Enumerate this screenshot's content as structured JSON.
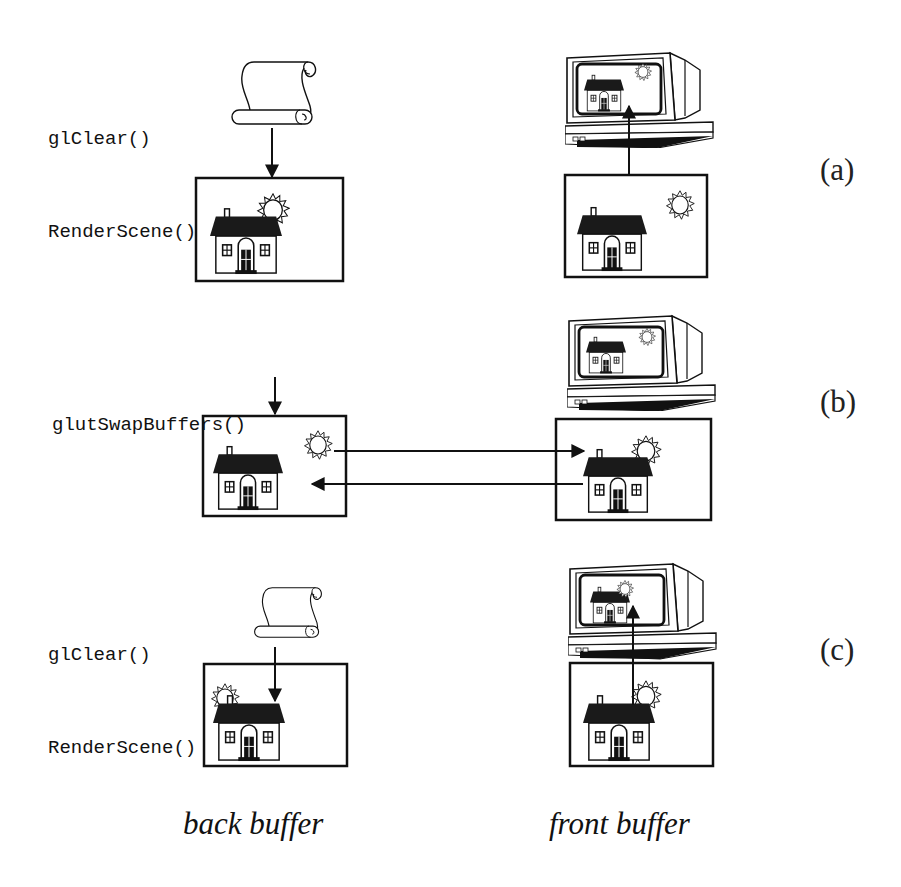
{
  "figure": {
    "type": "double-buffering-diagram",
    "rows": [
      {
        "id": "a",
        "label": "(a)",
        "code_lines": [
          "glClear()",
          "RenderScene()"
        ],
        "back_buffer": {
          "content": "house-with-sun-partially-drawn",
          "input_icon": "scroll-icon"
        },
        "front_buffer": {
          "content": "house-with-sun",
          "displayed_on": "monitor"
        },
        "arrows": [
          "scroll-to-back-buffer",
          "front-buffer-to-monitor"
        ]
      },
      {
        "id": "b",
        "label": "(b)",
        "code_lines": [
          "glutSwapBuffers()"
        ],
        "back_buffer": {
          "content": "house-with-sun"
        },
        "front_buffer": {
          "content": "house-with-sun-partially-drawn",
          "displayed_on": "monitor"
        },
        "arrows": [
          "call-to-back-buffer",
          "back-to-front-swap",
          "front-to-back-swap"
        ]
      },
      {
        "id": "c",
        "label": "(c)",
        "code_lines": [
          "glClear()",
          "RenderScene()"
        ],
        "back_buffer": {
          "content": "house-with-sun-left",
          "input_icon": "scroll-icon"
        },
        "front_buffer": {
          "content": "house-with-sun-partially-drawn",
          "displayed_on": "monitor"
        },
        "arrows": [
          "scroll-to-back-buffer",
          "front-buffer-to-monitor"
        ]
      }
    ],
    "captions": {
      "back": "back buffer",
      "front": "front buffer"
    }
  },
  "colors": {
    "ink": "#111111",
    "background": "#ffffff",
    "roof": "#1a1a1a"
  }
}
